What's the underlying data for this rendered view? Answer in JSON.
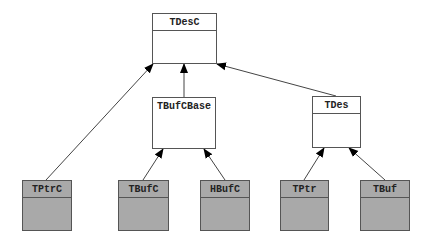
{
  "diagram": {
    "type": "class-inheritance",
    "classes": [
      {
        "id": "tdesc",
        "name": "TDesC",
        "x": 152,
        "y": 13,
        "w": 65,
        "h": 51,
        "style": "abstract",
        "divider": true
      },
      {
        "id": "tbufcbase",
        "name": "TBufCBase",
        "x": 152,
        "y": 97,
        "w": 64,
        "h": 52,
        "style": "abstract",
        "divider": false
      },
      {
        "id": "tdes",
        "name": "TDes",
        "x": 312,
        "y": 96,
        "w": 49,
        "h": 52,
        "style": "abstract",
        "divider": true
      },
      {
        "id": "tptrc",
        "name": "TPtrC",
        "x": 22,
        "y": 180,
        "w": 50,
        "h": 51,
        "style": "concrete",
        "divider": true
      },
      {
        "id": "tbufc",
        "name": "TBufC",
        "x": 118,
        "y": 180,
        "w": 51,
        "h": 51,
        "style": "concrete",
        "divider": true
      },
      {
        "id": "hbufc",
        "name": "HBufC",
        "x": 200,
        "y": 180,
        "w": 50,
        "h": 51,
        "style": "concrete",
        "divider": true
      },
      {
        "id": "tptr",
        "name": "TPtr",
        "x": 280,
        "y": 180,
        "w": 49,
        "h": 51,
        "style": "concrete",
        "divider": true
      },
      {
        "id": "tbuf",
        "name": "TBuf",
        "x": 360,
        "y": 180,
        "w": 50,
        "h": 51,
        "style": "concrete",
        "divider": true
      }
    ],
    "edges": [
      {
        "from": "TPtrC",
        "to": "TDesC",
        "x1": 46,
        "y1": 180,
        "x2": 153,
        "y2": 64
      },
      {
        "from": "TBufCBase",
        "to": "TDesC",
        "x1": 184,
        "y1": 97,
        "x2": 184,
        "y2": 64
      },
      {
        "from": "TDes",
        "to": "TDesC",
        "x1": 336,
        "y1": 96,
        "x2": 217,
        "y2": 64
      },
      {
        "from": "TBufC",
        "to": "TBufCBase",
        "x1": 143,
        "y1": 180,
        "x2": 163,
        "y2": 149
      },
      {
        "from": "HBufC",
        "to": "TBufCBase",
        "x1": 225,
        "y1": 180,
        "x2": 204,
        "y2": 149
      },
      {
        "from": "TPtr",
        "to": "TDes",
        "x1": 304,
        "y1": 180,
        "x2": 324,
        "y2": 148
      },
      {
        "from": "TBuf",
        "to": "TDes",
        "x1": 385,
        "y1": 180,
        "x2": 349,
        "y2": 148
      }
    ],
    "colors": {
      "abstract_fill": "#ffffff",
      "concrete_fill": "#a9a9a9",
      "border": "#555555",
      "edge": "#444444",
      "arrowhead": "#000000",
      "text": "#222222"
    }
  }
}
